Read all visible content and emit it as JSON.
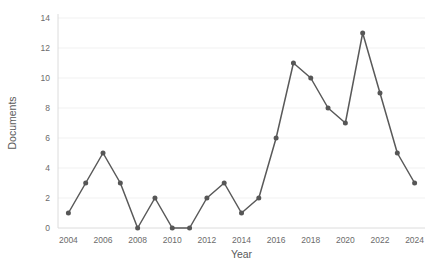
{
  "chart_data": {
    "type": "line",
    "title": "",
    "xlabel": "Year",
    "ylabel": "Documents",
    "x": [
      2004,
      2005,
      2006,
      2007,
      2008,
      2009,
      2010,
      2011,
      2012,
      2013,
      2014,
      2015,
      2016,
      2017,
      2018,
      2019,
      2020,
      2021,
      2022,
      2023,
      2024
    ],
    "series": [
      {
        "name": "Documents",
        "values": [
          1,
          3,
          5,
          3,
          0,
          2,
          0,
          0,
          2,
          3,
          1,
          2,
          6,
          11,
          10,
          8,
          7,
          13,
          9,
          5,
          3
        ]
      }
    ],
    "xlim": [
      2003.4,
      2024.6
    ],
    "ylim": [
      0,
      14
    ],
    "xticks": [
      2004,
      2006,
      2008,
      2010,
      2012,
      2014,
      2016,
      2018,
      2020,
      2022,
      2024
    ],
    "xtick_labels": [
      "2004",
      "2006",
      "2008",
      "2010",
      "2012",
      "2014",
      "2016",
      "2018",
      "2020",
      "2022",
      "2024"
    ],
    "yticks": [
      0,
      2,
      4,
      6,
      8,
      10,
      12,
      14
    ],
    "ytick_labels": [
      "0",
      "2",
      "4",
      "6",
      "8",
      "10",
      "12",
      "14"
    ],
    "grid": true,
    "grid_axis": "y",
    "legend": false,
    "legend_position": "none",
    "marker": "circle",
    "colors": {
      "line": "#595959",
      "marker": "#565656",
      "gridline": "#ededed",
      "axis": "#d8d8d8",
      "tick_text": "#6b6b6b",
      "axis_title_text": "#5a5a5a",
      "background": "#ffffff"
    }
  }
}
